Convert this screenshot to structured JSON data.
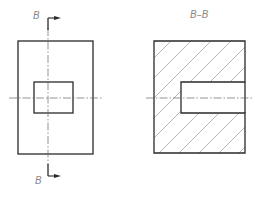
{
  "drawing": {
    "section_mark_top": "B",
    "section_mark_bottom": "B",
    "section_view_title": "B–B",
    "colors": {
      "outline": "#2a2a2a",
      "centerline": "#555555",
      "hatch": "#9a9a9a",
      "label": "#8a8a8a"
    }
  }
}
